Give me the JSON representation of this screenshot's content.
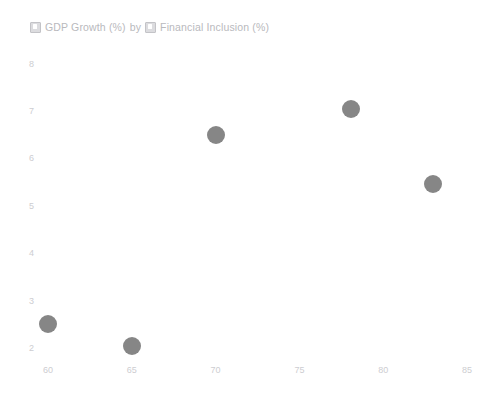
{
  "chart_data": {
    "type": "scatter",
    "title": "GDP Growth (%) by Financial Inclusion (%)",
    "title_parts": {
      "measure_icon": "field-badge-icon",
      "measure_label": "GDP Growth (%)",
      "conjunction": "by",
      "dimension_icon": "field-badge-icon",
      "dimension_label": "Financial Inclusion (%)"
    },
    "xlabel": "Financial Inclusion (%)",
    "ylabel": "GDP Growth (%)",
    "xlim": [
      57.5,
      87.0
    ],
    "ylim": [
      1.75,
      8.35
    ],
    "x_ticks": [
      60,
      65,
      70,
      75,
      80,
      85
    ],
    "y_ticks": [
      2,
      3,
      4,
      5,
      6,
      7,
      8
    ],
    "grid": false,
    "axis_lines": false,
    "legend": "none",
    "marker_color": "#6b6b6b",
    "marker_radius_px": 9,
    "points": [
      {
        "x": 60.0,
        "y": 2.5
      },
      {
        "x": 65.0,
        "y": 2.05
      },
      {
        "x": 70.0,
        "y": 6.5
      },
      {
        "x": 78.1,
        "y": 7.05
      },
      {
        "x": 83.0,
        "y": 5.47
      }
    ]
  },
  "colors": {
    "background": "#ffffff",
    "marker": "#6b6b6b",
    "tick_text": "#cdcdd1",
    "title_text": "#b9b9bd"
  }
}
